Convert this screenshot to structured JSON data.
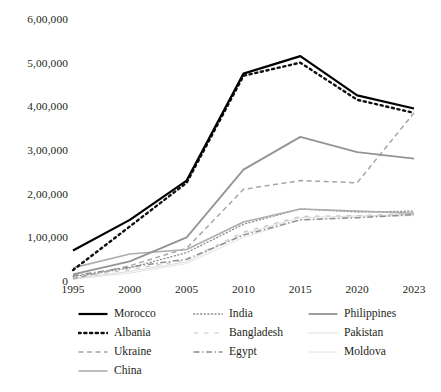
{
  "chart_data": {
    "type": "line",
    "title": "",
    "subtitle": "",
    "xlabel": "",
    "ylabel": "",
    "x": [
      1995,
      2000,
      2005,
      2010,
      2015,
      2020,
      2023
    ],
    "x_tick_labels": [
      "1995",
      "2000",
      "2005",
      "2010",
      "2015",
      "2020",
      "2023"
    ],
    "y_tick_labels": [
      "0",
      "1,00,000",
      "2,00,000",
      "3,00,000",
      "4,00,000",
      "5,00,000",
      "6,00,000"
    ],
    "y_tick_values": [
      0,
      100000,
      200000,
      300000,
      400000,
      500000,
      600000
    ],
    "ylim": [
      0,
      600000
    ],
    "xlim": [
      1995,
      2023
    ],
    "grid": false,
    "axis_lines": false,
    "legend_position": "bottom",
    "legend_columns": 3,
    "number_format": "indian-lakh",
    "series": [
      {
        "name": "Morocco",
        "values": [
          70000,
          140000,
          230000,
          475000,
          515000,
          425000,
          395000
        ],
        "color": "#000000",
        "style": "solid",
        "width": 2.2
      },
      {
        "name": "India",
        "values": [
          10000,
          30000,
          65000,
          130000,
          165000,
          158000,
          160000
        ],
        "color": "#8c8c8c",
        "style": "dotted",
        "width": 1.3
      },
      {
        "name": "Philippines",
        "values": [
          15000,
          45000,
          100000,
          255000,
          330000,
          295000,
          280000
        ],
        "color": "#949494",
        "style": "solid",
        "width": 1.8
      },
      {
        "name": "Albania",
        "values": [
          25000,
          125000,
          225000,
          470000,
          500000,
          415000,
          385000
        ],
        "color": "#111111",
        "style": "dotted-heavy",
        "width": 2.4
      },
      {
        "name": "Bangladesh",
        "values": [
          8000,
          26000,
          48000,
          112000,
          148000,
          150000,
          154000
        ],
        "color": "#c8c8c8",
        "style": "dashed-sparse",
        "width": 1.2
      },
      {
        "name": "Pakistan",
        "values": [
          6000,
          22000,
          44000,
          108000,
          145000,
          149000,
          152000
        ],
        "color": "#dcdcdc",
        "style": "solid",
        "width": 1.0
      },
      {
        "name": "Ukraine",
        "values": [
          5000,
          35000,
          75000,
          210000,
          230000,
          225000,
          385000
        ],
        "color": "#a6a6a6",
        "style": "dashed",
        "width": 1.5
      },
      {
        "name": "Egypt",
        "values": [
          12000,
          32000,
          50000,
          105000,
          140000,
          145000,
          152000
        ],
        "color": "#8f8f8f",
        "style": "dash-dot",
        "width": 1.5
      },
      {
        "name": "Moldova",
        "values": [
          4000,
          18000,
          40000,
          100000,
          140000,
          146000,
          150000
        ],
        "color": "#e4e4e4",
        "style": "solid",
        "width": 1.0
      },
      {
        "name": "China",
        "values": [
          30000,
          62000,
          72000,
          135000,
          165000,
          160000,
          155000
        ],
        "color": "#adadad",
        "style": "solid",
        "width": 1.6
      }
    ]
  },
  "legend": {
    "items": [
      {
        "label": "Morocco",
        "series": 0,
        "col": 0,
        "row": 0
      },
      {
        "label": "India",
        "series": 1,
        "col": 1,
        "row": 0
      },
      {
        "label": "Philippines",
        "series": 2,
        "col": 2,
        "row": 0
      },
      {
        "label": "Albania",
        "series": 3,
        "col": 0,
        "row": 1
      },
      {
        "label": "Bangladesh",
        "series": 4,
        "col": 1,
        "row": 1
      },
      {
        "label": "Pakistan",
        "series": 5,
        "col": 2,
        "row": 1
      },
      {
        "label": "Ukraine",
        "series": 6,
        "col": 0,
        "row": 2
      },
      {
        "label": "Egypt",
        "series": 7,
        "col": 1,
        "row": 2
      },
      {
        "label": "Moldova",
        "series": 8,
        "col": 2,
        "row": 2
      },
      {
        "label": "China",
        "series": 9,
        "col": 0,
        "row": 3
      }
    ]
  },
  "caption": {
    "text": ""
  }
}
